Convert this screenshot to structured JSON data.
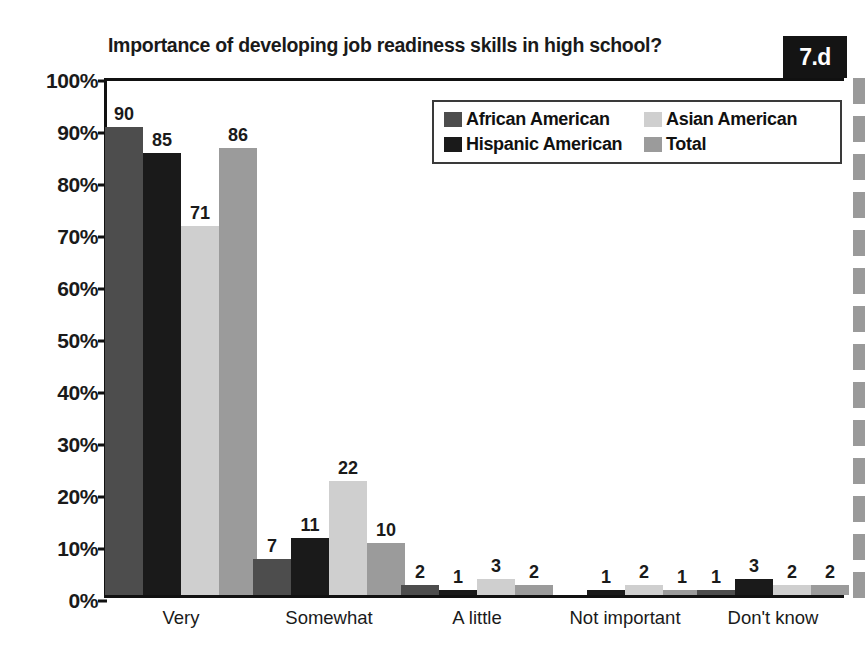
{
  "badge": {
    "text": "7.d"
  },
  "chart_data": {
    "type": "bar",
    "title": "Importance of developing job readiness skills in high school?",
    "xlabel": "",
    "ylabel": "",
    "ylim": [
      0,
      100
    ],
    "grid": false,
    "legend_position": "top-right",
    "y_ticks": [
      "0%",
      "10%",
      "20%",
      "30%",
      "40%",
      "50%",
      "60%",
      "70%",
      "80%",
      "90%",
      "100%"
    ],
    "y_tick_values": [
      0,
      10,
      20,
      30,
      40,
      50,
      60,
      70,
      80,
      90,
      100
    ],
    "categories": [
      "Very",
      "Somewhat",
      "A little",
      "Not important",
      "Don't know"
    ],
    "series": [
      {
        "name": "African American",
        "color": "#4d4d4d",
        "values": [
          90,
          7,
          2,
          0,
          1
        ],
        "labels": [
          "90",
          "7",
          "2",
          "",
          "1"
        ]
      },
      {
        "name": "Hispanic American",
        "color": "#1a1a1a",
        "values": [
          85,
          11,
          1,
          1,
          3
        ],
        "labels": [
          "85",
          "11",
          "1",
          "1",
          "3"
        ]
      },
      {
        "name": "Asian American",
        "color": "#cfcfcf",
        "values": [
          71,
          22,
          3,
          2,
          2
        ],
        "labels": [
          "71",
          "22",
          "3",
          "2",
          "2"
        ]
      },
      {
        "name": "Total",
        "color": "#9b9b9b",
        "values": [
          86,
          10,
          2,
          1,
          2
        ],
        "labels": [
          "86",
          "10",
          "2",
          "1",
          "2"
        ]
      }
    ]
  }
}
